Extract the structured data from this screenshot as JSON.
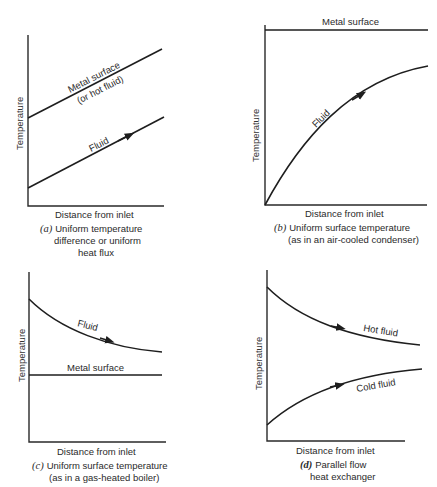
{
  "figure": {
    "panels": [
      {
        "id": "a",
        "y_axis_label": "Temperature",
        "x_axis_label": "Distance from inlet",
        "caption_letter": "(a)",
        "caption_lines": [
          "Uniform temperature",
          "difference or uniform",
          "heat flux"
        ],
        "curves": [
          {
            "name": "Metal surface",
            "label_line1": "Metal surface",
            "label_line2": "(or hot fluid)",
            "shape": "linear-rising"
          },
          {
            "name": "Fluid",
            "label": "Fluid",
            "shape": "linear-rising",
            "arrow": true
          }
        ]
      },
      {
        "id": "b",
        "y_axis_label": "Temperature",
        "x_axis_label": "Distance from inlet",
        "caption_letter": "(b)",
        "caption_lines": [
          "Uniform surface temperature",
          "(as in an air-cooled condenser)"
        ],
        "curves": [
          {
            "name": "Metal surface",
            "label": "Metal surface",
            "shape": "constant"
          },
          {
            "name": "Fluid",
            "label": "Fluid",
            "shape": "rising-concave",
            "arrow": true
          }
        ]
      },
      {
        "id": "c",
        "y_axis_label": "Temperature",
        "x_axis_label": "Distance from inlet",
        "caption_letter": "(c)",
        "caption_lines": [
          "Uniform surface temperature",
          "(as in a gas-heated boiler)"
        ],
        "curves": [
          {
            "name": "Fluid",
            "label": "Fluid",
            "shape": "falling-convex",
            "arrow": true
          },
          {
            "name": "Metal surface",
            "label": "Metal surface",
            "shape": "constant"
          }
        ]
      },
      {
        "id": "d",
        "y_axis_label": "Temperature",
        "x_axis_label": "Distance from inlet",
        "caption_letter": "(d)",
        "caption_lines": [
          "Parallel flow",
          "heat exchanger"
        ],
        "curves": [
          {
            "name": "Hot fluid",
            "label": "Hot fluid",
            "shape": "falling-convex",
            "arrow": true
          },
          {
            "name": "Cold fluid",
            "label": "Cold fluid",
            "shape": "rising-concave",
            "arrow": true
          }
        ]
      }
    ]
  }
}
